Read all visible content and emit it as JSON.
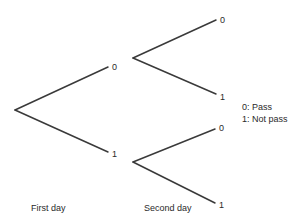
{
  "diagram": {
    "type": "binary-tree",
    "root": {
      "children": [
        {
          "label": "0",
          "children": [
            {
              "label": "0"
            },
            {
              "label": "1"
            }
          ]
        },
        {
          "label": "1",
          "children": [
            {
              "label": "0"
            },
            {
              "label": "1"
            }
          ]
        }
      ]
    },
    "levels": {
      "first": "First day",
      "second": "Second day"
    },
    "legend": [
      {
        "code": "0",
        "text": "0: Pass"
      },
      {
        "code": "1",
        "text": "1: Not pass"
      }
    ],
    "colors": {
      "line": "#3a3a3a",
      "text": "#2a2a2a",
      "background": "#ffffff"
    }
  }
}
